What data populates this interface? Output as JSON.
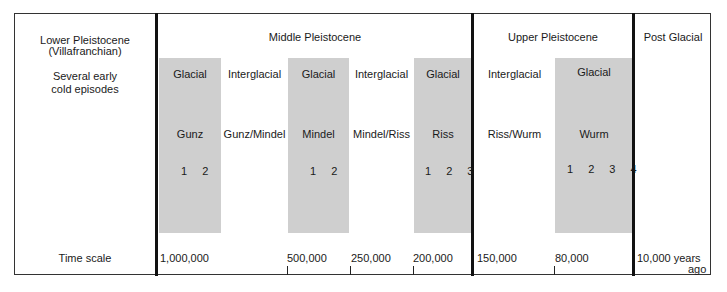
{
  "periods": {
    "lower": {
      "line1": "Lower Pleistocene",
      "line2": "(Villafranchian)",
      "note1": "Several early",
      "note2": "cold episodes"
    },
    "middle": {
      "label": "Middle Pleistocene"
    },
    "upper": {
      "label": "Upper Pleistocene"
    },
    "post": {
      "label": "Post Glacial"
    }
  },
  "stages": [
    {
      "type": "Glacial",
      "name": "Gunz",
      "substages": "1 2"
    },
    {
      "type": "Interglacial",
      "name": "Gunz/Mindel"
    },
    {
      "type": "Glacial",
      "name": "Mindel",
      "substages": "1 2"
    },
    {
      "type": "Interglacial",
      "name": "Mindel/Riss"
    },
    {
      "type": "Glacial",
      "name": "Riss",
      "substages": "1 2 3"
    },
    {
      "type": "Interglacial",
      "name": "Riss/Wurm"
    },
    {
      "type": "Glacial",
      "name": "Wurm",
      "substages": "1 2 3 4"
    }
  ],
  "timescale": {
    "label": "Time scale",
    "values": [
      "1,000,000",
      "500,000",
      "250,000",
      "200,000",
      "150,000",
      "80,000",
      "10,000 years"
    ],
    "last_suffix": "ago"
  },
  "colors": {
    "glacial_band": "#cfcfcf",
    "divider": "#111111"
  }
}
